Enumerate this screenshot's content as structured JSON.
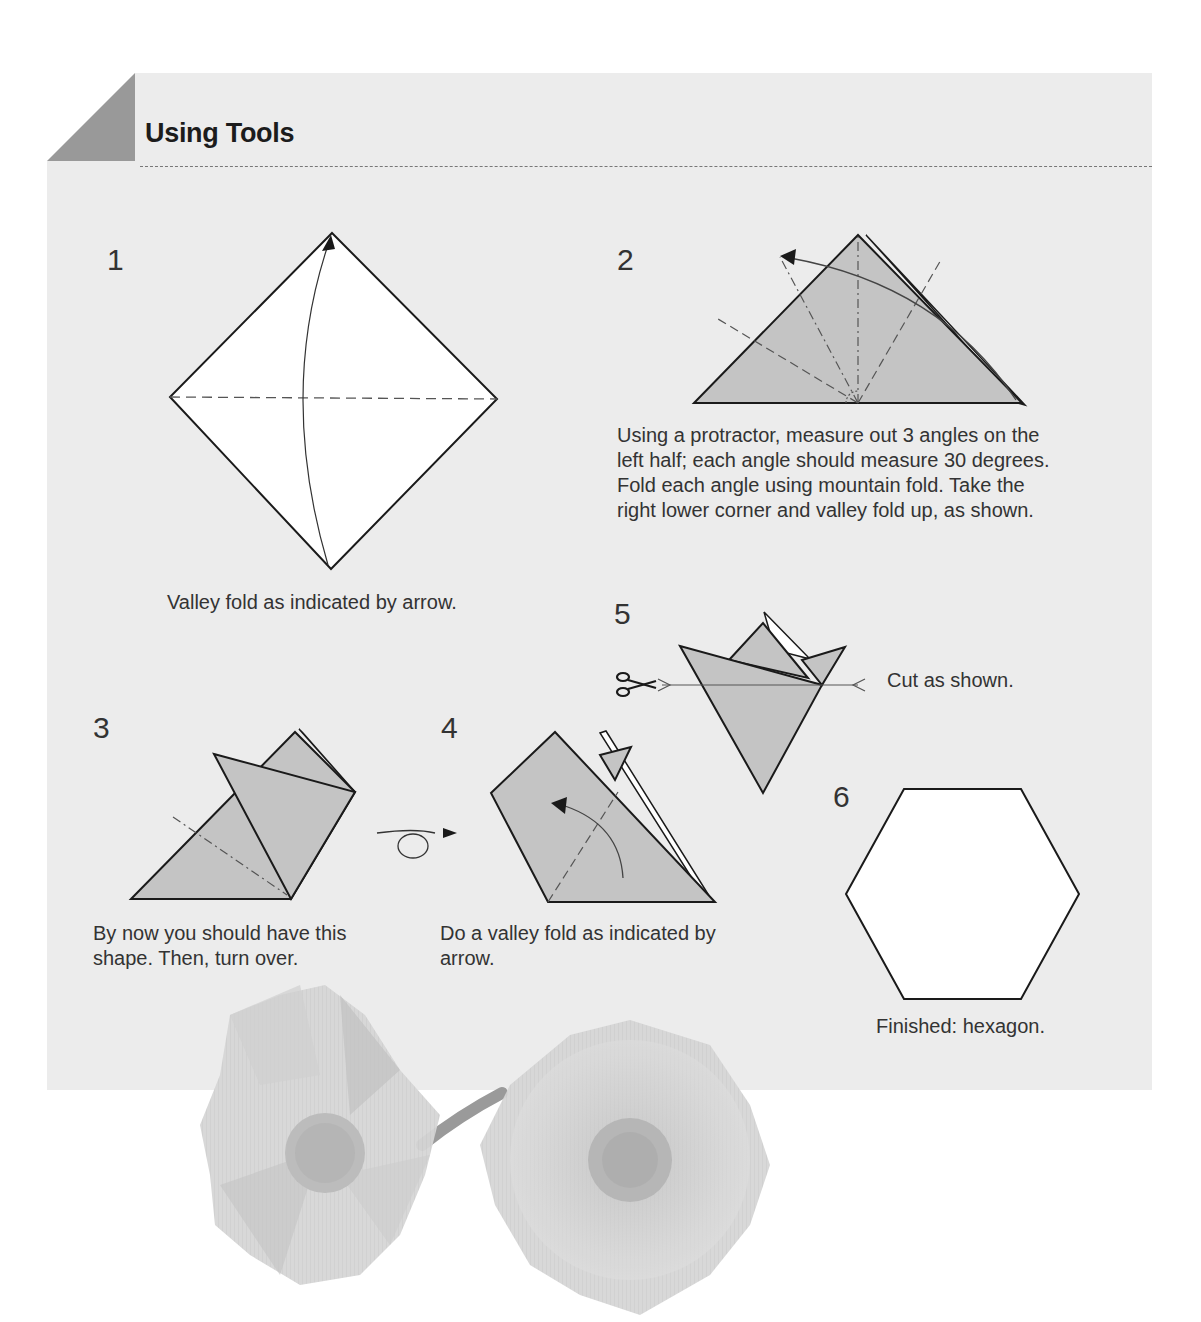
{
  "page": {
    "section_title": "Using Tools",
    "colors": {
      "panel_bg": "#ececec",
      "corner_tab": "#999999",
      "paper_fill": "#c4c4c4",
      "paper_white": "#ffffff",
      "line": "#1a1a1a"
    }
  },
  "steps": [
    {
      "number": "1",
      "caption": "Valley fold as indicated by arrow."
    },
    {
      "number": "2",
      "caption": "Using a protractor, measure out 3 angles on the left half; each angle should measure 30 degrees. Fold each angle using mountain fold. Take the right lower corner and valley fold up, as shown."
    },
    {
      "number": "3",
      "caption": "By now you should have this shape. Then, turn over."
    },
    {
      "number": "4",
      "caption": "Do a valley fold as indicated by arrow."
    },
    {
      "number": "5",
      "caption": "Cut as shown."
    },
    {
      "number": "6",
      "caption": "Finished: hexagon."
    }
  ],
  "photo": {
    "subject": "Two folded paper flowers with pom-pom centers joined by a stem"
  }
}
